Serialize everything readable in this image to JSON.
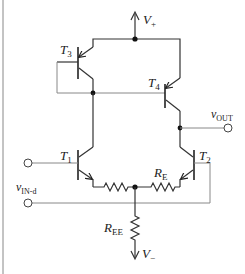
{
  "diagram": {
    "type": "circuit-schematic",
    "title": "",
    "nodes": {
      "supply_positive": {
        "label": "V",
        "sub": "+"
      },
      "supply_negative": {
        "label": "V",
        "sub": "−"
      },
      "output": {
        "label": "v",
        "sub": "OUT"
      },
      "differential_input": {
        "label": "v",
        "sub": "IN-d"
      }
    },
    "transistors": [
      {
        "id": "T3",
        "label": "T",
        "sub": "3",
        "type": "pnp",
        "role": "current mirror (diode-connected)"
      },
      {
        "id": "T4",
        "label": "T",
        "sub": "4",
        "type": "pnp",
        "role": "current mirror output"
      },
      {
        "id": "T1",
        "label": "T",
        "sub": "1",
        "type": "npn",
        "role": "differential pair input"
      },
      {
        "id": "T2",
        "label": "T",
        "sub": "2",
        "type": "npn",
        "role": "differential pair input"
      }
    ],
    "resistors": [
      {
        "id": "RE_left",
        "label": "",
        "sub": "",
        "orientation": "horizontal"
      },
      {
        "id": "RE_right",
        "label": "R",
        "sub": "E",
        "orientation": "horizontal"
      },
      {
        "id": "REE",
        "label": "R",
        "sub": "EE",
        "orientation": "vertical"
      }
    ],
    "terminals": [
      {
        "id": "in_T1",
        "connects": "T1 base"
      },
      {
        "id": "in_d",
        "connects": "T2 base via vIN-d"
      },
      {
        "id": "out",
        "connects": "T4/T2 collector node"
      }
    ]
  }
}
